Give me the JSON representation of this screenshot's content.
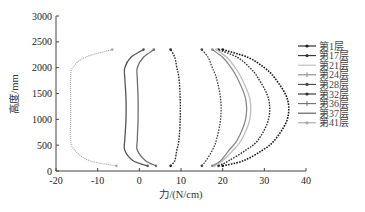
{
  "chart_data": {
    "type": "line",
    "title": "",
    "xlabel": "力/(N/cm)",
    "ylabel": "高度/mm",
    "xlim": [
      -20,
      40
    ],
    "ylim": [
      0,
      3000
    ],
    "xticks": [
      -20,
      -10,
      0,
      10,
      20,
      30,
      40
    ],
    "yticks": [
      0,
      500,
      1000,
      1500,
      2000,
      2500,
      3000
    ],
    "grid": false,
    "legend_position": "right",
    "y": [
      100,
      200,
      400,
      600,
      1000,
      1400,
      1800,
      2000,
      2200,
      2350
    ],
    "series": [
      {
        "name": "第1层",
        "color": "#1a1a1a",
        "marker": "dot",
        "width": 1.6,
        "values": [
          20,
          25,
          29.5,
          32.5,
          35.5,
          35.5,
          32.5,
          30,
          26,
          20
        ]
      },
      {
        "name": "第17层",
        "color": "#333333",
        "marker": "dot",
        "width": 1.4,
        "values": [
          19,
          21.5,
          25.5,
          28.5,
          31,
          31,
          28.5,
          26.5,
          23.5,
          19
        ]
      },
      {
        "name": "第21层",
        "color": "#bdbdbd",
        "marker": "none",
        "width": 1.3,
        "values": [
          18,
          20,
          22.5,
          24.5,
          26.5,
          26.5,
          24.5,
          23,
          21,
          18.5
        ]
      },
      {
        "name": "第24层",
        "color": "#8a8a8a",
        "marker": "plus",
        "width": 1.3,
        "values": [
          17.5,
          19.5,
          21.5,
          23.5,
          25.5,
          25.5,
          23.5,
          22,
          20,
          17.5
        ]
      },
      {
        "name": "第28层",
        "color": "#444444",
        "marker": "dot",
        "width": 1.3,
        "values": [
          15,
          16,
          17.5,
          18.5,
          19.5,
          19.5,
          18.5,
          17.5,
          16.5,
          15
        ]
      },
      {
        "name": "第32层",
        "color": "#2b2b2b",
        "marker": "dot",
        "width": 1.4,
        "values": [
          7.5,
          8.5,
          9,
          9.5,
          9.8,
          9.8,
          9.5,
          9,
          8.5,
          7.5
        ]
      },
      {
        "name": "第36层",
        "color": "#6e6e6e",
        "marker": "plus",
        "width": 1.3,
        "values": [
          4,
          1.5,
          -0.5,
          -0.5,
          -0.3,
          -0.3,
          -0.5,
          -0.5,
          1,
          3.5
        ]
      },
      {
        "name": "第37层",
        "color": "#555555",
        "marker": "none",
        "width": 1.3,
        "values": [
          2,
          -1.5,
          -3.5,
          -3.5,
          -3.2,
          -3.2,
          -3.5,
          -3.5,
          -2,
          1
        ]
      },
      {
        "name": "第41层",
        "color": "#a8a8a8",
        "marker": "dot-small",
        "width": 1.2,
        "values": [
          -5.5,
          -12,
          -15.5,
          -16.5,
          -16.5,
          -16.5,
          -16.5,
          -16,
          -13,
          -6.5
        ]
      }
    ]
  }
}
